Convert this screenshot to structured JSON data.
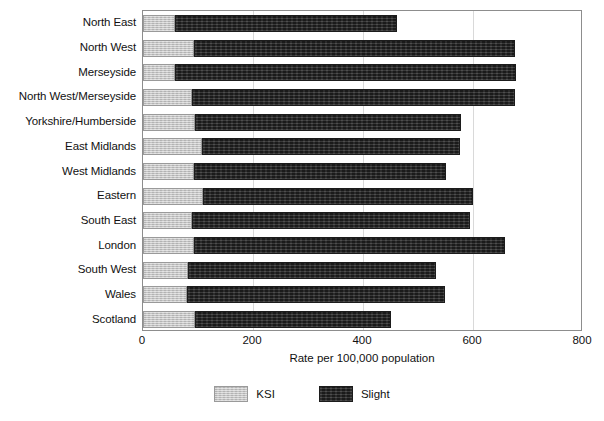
{
  "chart_data": {
    "type": "bar",
    "orientation": "horizontal",
    "stacked": true,
    "title": "",
    "xlabel": "Rate per 100,000 population",
    "ylabel": "",
    "xlim": [
      0,
      800
    ],
    "xticks": [
      0,
      200,
      400,
      600,
      800
    ],
    "grid": true,
    "legend_position": "bottom",
    "categories": [
      "North East",
      "North West",
      "Merseyside",
      "North West/Merseyside",
      "Yorkshire/Humberside",
      "East Midlands",
      "West Midlands",
      "Eastern",
      "South East",
      "London",
      "South West",
      "Wales",
      "Scotland"
    ],
    "series": [
      {
        "name": "KSI",
        "color": "#c6c6c6",
        "values": [
          58,
          93,
          58,
          89,
          95,
          107,
          93,
          109,
          89,
          93,
          82,
          80,
          95
        ]
      },
      {
        "name": "Slight",
        "color": "#2b2b2b",
        "values": [
          404,
          583,
          620,
          587,
          483,
          470,
          458,
          491,
          506,
          565,
          451,
          469,
          356
        ]
      }
    ],
    "totals": [
      462,
      676,
      678,
      676,
      578,
      577,
      551,
      600,
      595,
      658,
      533,
      549,
      451
    ]
  },
  "axis": {
    "tick_labels": [
      "0",
      "200",
      "400",
      "600",
      "800"
    ],
    "title": "Rate per 100,000 population"
  },
  "legend": {
    "items": [
      {
        "label": "KSI",
        "color": "#c6c6c6"
      },
      {
        "label": "Slight",
        "color": "#2b2b2b"
      }
    ]
  }
}
